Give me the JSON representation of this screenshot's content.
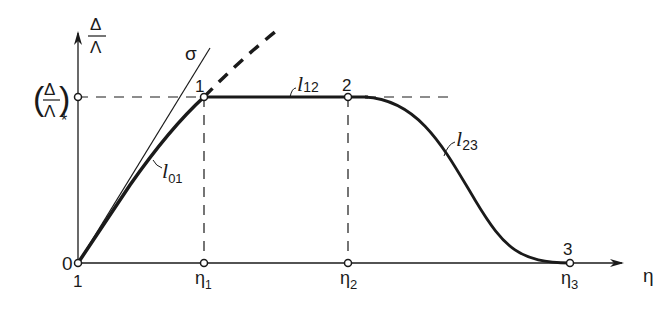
{
  "diagram": {
    "y_axis": {
      "numerator": "Δ",
      "denominator": "Λ",
      "critical_numerator": "Δ",
      "critical_denominator": "Λ",
      "critical_subscript": "*",
      "origin_label": "0"
    },
    "x_axis": {
      "label": "η",
      "origin_label": "1",
      "ticks": [
        {
          "base": "η",
          "sub": "1"
        },
        {
          "base": "η",
          "sub": "2"
        },
        {
          "base": "η",
          "sub": "3"
        }
      ]
    },
    "points": [
      "1",
      "2",
      "3"
    ],
    "curves": {
      "l01": {
        "base": "l",
        "sub": "01"
      },
      "l12": {
        "base": "l",
        "sub": "12"
      },
      "l23": {
        "base": "l",
        "sub": "23"
      }
    },
    "tangent_label": "σ",
    "colors": {
      "ink": "#1a1a1a",
      "background": "#ffffff"
    }
  }
}
